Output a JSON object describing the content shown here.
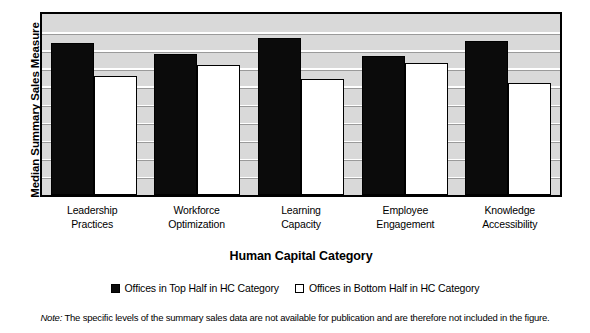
{
  "chart_data": {
    "type": "bar",
    "title": "",
    "xlabel": "Human Capital Category",
    "ylabel": "Median Summary Sales Measure",
    "categories": [
      "Leadership Practices",
      "Workforce Optimization",
      "Learning Capacity",
      "Employee Engagement",
      "Knowledge Accessibility"
    ],
    "category_lines": [
      [
        "Leadership",
        "Practices"
      ],
      [
        "Workforce",
        "Optimization"
      ],
      [
        "Learning",
        "Capacity"
      ],
      [
        "Employee",
        "Engagement"
      ],
      [
        "Knowledge",
        "Accessibility"
      ]
    ],
    "series": [
      {
        "name": "Offices in Top Half in HC Category",
        "color": "#0b0b0b",
        "style": "filled",
        "values": [
          84,
          78,
          87,
          77,
          85
        ]
      },
      {
        "name": "Offices in Bottom Half in HC Category",
        "color": "#ffffff",
        "style": "open",
        "values": [
          66,
          72,
          64,
          73,
          62
        ]
      }
    ],
    "ylim": [
      0,
      100
    ],
    "y_tick_labels": [],
    "grid": true,
    "gridline_count": 9,
    "legend_position": "bottom",
    "plot_background": "#d9d9d9",
    "note": "The specific levels of the summary sales data are not available for publication and are therefore not included in the figure."
  },
  "legend": {
    "entries": [
      {
        "label": "Offices in Top Half in HC Category",
        "swatch": "filled-square-icon"
      },
      {
        "label": "Offices in Bottom Half in HC Category",
        "swatch": "open-square-icon"
      }
    ]
  },
  "footnote": {
    "label": "Note:",
    "text": " The specific levels of the summary sales data are not available for publication and are therefore not included in the figure."
  }
}
